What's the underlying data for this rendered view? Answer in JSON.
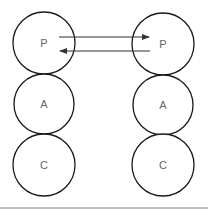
{
  "diagram": {
    "columns": [
      {
        "name": "left",
        "nodes": [
          {
            "label": "P"
          },
          {
            "label": "A"
          },
          {
            "label": "C"
          }
        ]
      },
      {
        "name": "right",
        "nodes": [
          {
            "label": "P"
          },
          {
            "label": "A"
          },
          {
            "label": "C"
          }
        ]
      }
    ],
    "edges": [
      {
        "from": "left.P",
        "to": "right.P",
        "direction": "left-to-right"
      },
      {
        "from": "right.P",
        "to": "left.P",
        "direction": "right-to-left"
      }
    ],
    "colors": {
      "stroke": "#1a1a1a",
      "label": "#666666",
      "arrow": "#333333",
      "divider": "#bdbdbd"
    }
  }
}
